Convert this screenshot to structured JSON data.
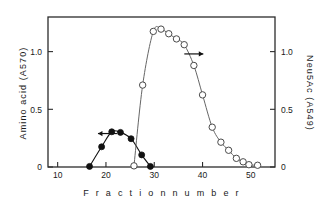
{
  "chart_data": {
    "type": "scatter",
    "title": "",
    "xlabel": "F r a c t i o n   n u m b e r",
    "xlabel_plain": "Fraction number",
    "ylabel_left": "Amino acid (A570)",
    "ylabel_right": "Neu5Ac (A549)",
    "xlim": [
      8,
      55
    ],
    "ylim_left": [
      0,
      1.3
    ],
    "ylim_right": [
      0,
      1.3
    ],
    "xticks": [
      10,
      20,
      30,
      40,
      50
    ],
    "xtick_labels": [
      "10",
      "20",
      "30",
      "40",
      "50"
    ],
    "yticks_left": [
      0,
      0.5,
      1.0
    ],
    "ytick_labels_left": [
      "0",
      "0.5",
      "1.0"
    ],
    "yticks_right": [
      0,
      0.5,
      1.0
    ],
    "ytick_labels_right": [
      "0",
      "0.5",
      "1.0"
    ],
    "grid": false,
    "legend": "none",
    "frame": "box",
    "series": [
      {
        "name": "Amino acid (A570)",
        "marker": "filled-circle",
        "axis": "left",
        "color": "#111111",
        "x": [
          16.6,
          19.1,
          21.2,
          23.0,
          25.2,
          27.4,
          29.2
        ],
        "y": [
          0.005,
          0.175,
          0.305,
          0.3,
          0.245,
          0.105,
          0.005
        ]
      },
      {
        "name": "Neu5Ac (A549)",
        "marker": "open-circle",
        "axis": "right",
        "color": "#555555",
        "x": [
          25.8,
          27.6,
          29.8,
          31.4,
          33.0,
          34.6,
          36.2,
          38.2,
          40.0,
          42.0,
          43.8,
          45.4,
          47.0,
          48.4,
          49.6,
          51.4
        ],
        "y": [
          0.01,
          0.71,
          1.175,
          1.195,
          1.155,
          1.11,
          1.06,
          0.88,
          0.625,
          0.345,
          0.215,
          0.145,
          0.075,
          0.045,
          0.02,
          0.015
        ]
      }
    ],
    "annotations": [
      {
        "name": "left-arrow",
        "text": "←",
        "x": 20.0,
        "y_left": 0.29,
        "points_to": "Amino acid (A570)"
      },
      {
        "name": "right-arrow",
        "text": "→",
        "x": 38.5,
        "y_right": 0.98,
        "points_to": "Neu5Ac (A549)"
      }
    ]
  }
}
